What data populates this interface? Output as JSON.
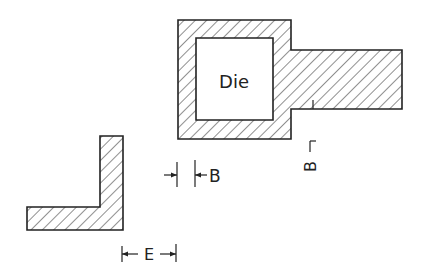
{
  "diagram": {
    "die_label": "Die",
    "dimension_b_label": "B",
    "dimension_e_label": "E",
    "section_marker_label": "B",
    "colors": {
      "line": "#222222",
      "background": "#ffffff"
    }
  }
}
